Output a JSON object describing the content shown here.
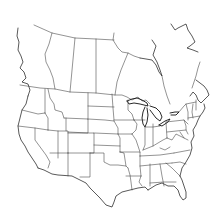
{
  "map": {
    "title": "",
    "type": "blank outline map",
    "region": "North America (United States and Canada)",
    "labels": [],
    "colors": {
      "background": "#ffffff",
      "stroke": "#3a3a3a"
    }
  }
}
